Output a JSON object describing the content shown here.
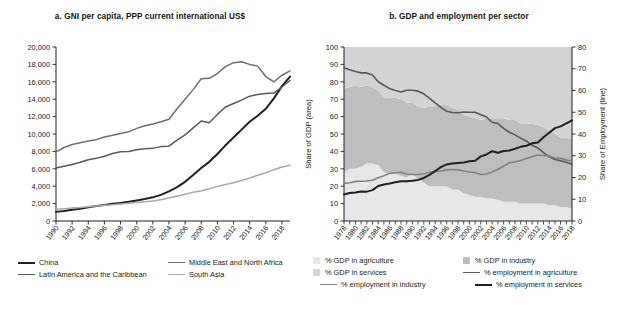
{
  "figure": {
    "background": "#ffffff"
  },
  "panel_a": {
    "title": "a. GNI per capita, PPP current international US$",
    "legend": [
      {
        "label": "China",
        "color": "#231f20",
        "marker": "line",
        "width": 2.2
      },
      {
        "label": "Middle East and North Africa",
        "color": "#6d6e71",
        "marker": "line",
        "width": 1.6
      },
      {
        "label": "Latin America and the Caribbean",
        "color": "#58595b",
        "marker": "line",
        "width": 1.6
      },
      {
        "label": "South Asia",
        "color": "#a7a9ac",
        "marker": "line",
        "width": 1.6
      }
    ]
  },
  "panel_b": {
    "title": "b. GDP and employment per sector",
    "legend": [
      {
        "label": "% GDP in agriculture",
        "color": "#e6e7e8",
        "marker": "box"
      },
      {
        "label": "% GDP in industry",
        "color": "#bcbec0",
        "marker": "box"
      },
      {
        "label": "% GDP in services",
        "color": "#d1d3d4",
        "marker": "box"
      },
      {
        "label": "% employment in agriculture",
        "color": "#58595b",
        "marker": "line"
      },
      {
        "label": "% employment in industry",
        "color": "#808285",
        "marker": "line"
      },
      {
        "label": "% employment in services",
        "color": "#231f20",
        "marker": "line"
      }
    ]
  },
  "chart_data": [
    {
      "id": "panel-a",
      "type": "line",
      "title": "a. GNI per capita, PPP current international US$",
      "xlabel": "",
      "ylabel": "",
      "ylim": [
        0,
        20000
      ],
      "yticks": [
        0,
        2000,
        4000,
        6000,
        8000,
        10000,
        12000,
        14000,
        16000,
        18000,
        20000
      ],
      "ytick_labels": [
        "0",
        "2,000",
        "4,000",
        "6,000",
        "8,000",
        "10,000",
        "12,000",
        "14,000",
        "16,000",
        "18,000",
        "20,000"
      ],
      "xlim": [
        1990,
        2019
      ],
      "xticks": [
        1990,
        1992,
        1994,
        1996,
        1998,
        2000,
        2002,
        2004,
        2006,
        2008,
        2010,
        2012,
        2014,
        2016,
        2018
      ],
      "xtick_labels": [
        "1990",
        "1992",
        "1994",
        "1996",
        "1998",
        "2000",
        "2002",
        "2004",
        "2006",
        "2008",
        "2010",
        "2012",
        "2014",
        "2016",
        "2018"
      ],
      "grid": false,
      "legend_position": "below",
      "x": [
        1990,
        1991,
        1992,
        1993,
        1994,
        1995,
        1996,
        1997,
        1998,
        1999,
        2000,
        2001,
        2002,
        2003,
        2004,
        2005,
        2006,
        2007,
        2008,
        2009,
        2010,
        2011,
        2012,
        2013,
        2014,
        2015,
        2016,
        2017,
        2018,
        2019
      ],
      "series": [
        {
          "name": "China",
          "color": "#231f20",
          "values": [
            1050,
            1150,
            1280,
            1420,
            1580,
            1720,
            1850,
            1980,
            2080,
            2200,
            2350,
            2520,
            2720,
            3000,
            3400,
            3900,
            4500,
            5300,
            6100,
            6800,
            7700,
            8700,
            9600,
            10500,
            11400,
            12100,
            12900,
            14100,
            15500,
            16600
          ]
        },
        {
          "name": "Latin America and the Caribbean",
          "color": "#58595b",
          "values": [
            6100,
            6300,
            6500,
            6750,
            7050,
            7200,
            7450,
            7750,
            7950,
            8000,
            8200,
            8300,
            8350,
            8550,
            8600,
            9300,
            9900,
            10700,
            11500,
            11300,
            12250,
            13100,
            13500,
            13900,
            14350,
            14550,
            14650,
            14700,
            15400,
            16150
          ]
        },
        {
          "name": "Middle East and North Africa",
          "color": "#6d6e71",
          "values": [
            7950,
            8450,
            8800,
            9000,
            9200,
            9350,
            9650,
            9850,
            10050,
            10250,
            10650,
            10950,
            11150,
            11400,
            11700,
            12900,
            14000,
            15100,
            16350,
            16400,
            16950,
            17750,
            18200,
            18300,
            18000,
            17800,
            16600,
            16000,
            16750,
            17250
          ]
        },
        {
          "name": "South Asia",
          "color": "#a7a9ac",
          "values": [
            1350,
            1420,
            1480,
            1550,
            1650,
            1720,
            1800,
            1870,
            1950,
            2050,
            2130,
            2210,
            2290,
            2450,
            2650,
            2850,
            3080,
            3300,
            3450,
            3700,
            3980,
            4200,
            4400,
            4650,
            4950,
            5250,
            5550,
            5900,
            6200,
            6400
          ]
        }
      ]
    },
    {
      "id": "panel-b",
      "type": "area",
      "title": "b. GDP and employment per sector",
      "ylabel": "Share of GDP (area)",
      "ylabel_right": "Share of Employment (line)",
      "ylim": [
        0,
        100
      ],
      "yticks": [
        0,
        10,
        20,
        30,
        40,
        50,
        60,
        70,
        80,
        90,
        100
      ],
      "ylim_right": [
        0,
        80
      ],
      "yticks_right": [
        0,
        10,
        20,
        30,
        40,
        50,
        60,
        70,
        80
      ],
      "xlim": [
        1978,
        2018
      ],
      "xticks": [
        1978,
        1980,
        1982,
        1984,
        1986,
        1988,
        1990,
        1992,
        1994,
        1996,
        1998,
        2000,
        2002,
        2004,
        2006,
        2008,
        2010,
        2012,
        2014,
        2016,
        2018
      ],
      "xtick_labels": [
        "1978",
        "1980",
        "1982",
        "1984",
        "1986",
        "1988",
        "1990",
        "1992",
        "1994",
        "1996",
        "1998",
        "2000",
        "2002",
        "2004",
        "2006",
        "2008",
        "2010",
        "2012",
        "2014",
        "2016",
        "2018"
      ],
      "grid": false,
      "legend_position": "below",
      "x": [
        1978,
        1979,
        1980,
        1981,
        1982,
        1983,
        1984,
        1985,
        1986,
        1987,
        1988,
        1989,
        1990,
        1991,
        1992,
        1993,
        1994,
        1995,
        1996,
        1997,
        1998,
        1999,
        2000,
        2001,
        2002,
        2003,
        2004,
        2005,
        2006,
        2007,
        2008,
        2009,
        2010,
        2011,
        2012,
        2013,
        2014,
        2015,
        2016,
        2017,
        2018
      ],
      "area_series": [
        {
          "name": "% GDP in agriculture",
          "color": "#e6e7e8",
          "values": [
            28,
            30,
            30,
            31,
            33,
            33,
            32,
            28,
            27,
            27,
            26,
            25,
            27,
            24,
            22,
            20,
            20,
            20,
            20,
            18,
            18,
            16,
            15,
            14,
            14,
            13,
            13,
            12,
            11,
            11,
            11,
            10,
            10,
            10,
            10,
            10,
            9,
            9,
            8,
            8,
            7
          ]
        },
        {
          "name": "% GDP in industry",
          "color": "#bcbec0",
          "values": [
            48,
            47,
            48,
            46,
            45,
            44,
            43,
            43,
            44,
            44,
            44,
            43,
            41,
            42,
            43,
            46,
            46,
            47,
            47,
            47,
            46,
            45,
            45,
            45,
            44,
            46,
            46,
            47,
            48,
            47,
            47,
            46,
            46,
            46,
            45,
            44,
            43,
            41,
            40,
            40,
            40
          ]
        },
        {
          "name": "% GDP in services",
          "color": "#d1d3d4",
          "values": [
            24,
            23,
            22,
            23,
            22,
            23,
            25,
            29,
            29,
            29,
            30,
            32,
            32,
            34,
            35,
            34,
            34,
            33,
            33,
            35,
            36,
            39,
            40,
            41,
            42,
            41,
            41,
            41,
            41,
            42,
            42,
            44,
            44,
            44,
            45,
            46,
            48,
            50,
            52,
            52,
            53
          ]
        }
      ],
      "line_series": [
        {
          "name": "% employment in agriculture",
          "color": "#58595b",
          "axis": "right",
          "values": [
            70.5,
            69.5,
            68.7,
            68.1,
            68.1,
            67.1,
            64.0,
            62.4,
            60.9,
            60.0,
            59.3,
            60.1,
            60.1,
            59.7,
            58.5,
            56.4,
            54.3,
            52.2,
            50.5,
            49.9,
            49.8,
            50.1,
            50.0,
            50.0,
            48.9,
            47.8,
            45.4,
            44.8,
            42.6,
            40.8,
            39.6,
            38.1,
            36.7,
            34.8,
            33.6,
            31.4,
            29.5,
            28.3,
            27.7,
            27.0,
            26.1
          ]
        },
        {
          "name": "% employment in industry",
          "color": "#808285",
          "axis": "right",
          "values": [
            17.3,
            17.6,
            18.2,
            18.3,
            18.4,
            18.7,
            19.9,
            20.8,
            21.9,
            22.2,
            22.4,
            21.6,
            21.4,
            21.4,
            21.7,
            22.4,
            22.7,
            23.0,
            23.5,
            23.7,
            23.5,
            23.0,
            22.5,
            22.3,
            21.4,
            21.6,
            22.5,
            23.8,
            25.2,
            26.8,
            27.2,
            27.8,
            28.7,
            29.5,
            30.3,
            30.1,
            29.9,
            29.0,
            28.8,
            28.1,
            27.6
          ]
        },
        {
          "name": "% employment in services",
          "color": "#231f20",
          "axis": "right",
          "values": [
            12.2,
            12.9,
            13.1,
            13.6,
            13.5,
            14.2,
            16.1,
            16.8,
            17.2,
            17.8,
            18.3,
            18.3,
            18.5,
            18.9,
            19.8,
            21.2,
            23.0,
            24.8,
            26.0,
            26.4,
            26.7,
            26.9,
            27.5,
            27.7,
            29.7,
            30.6,
            32.1,
            31.4,
            32.2,
            32.4,
            33.2,
            34.1,
            34.6,
            35.7,
            36.1,
            38.5,
            40.6,
            42.7,
            43.5,
            44.9,
            46.3
          ]
        }
      ]
    }
  ]
}
